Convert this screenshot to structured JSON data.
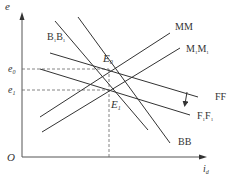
{
  "diagram": {
    "type": "economics-curves",
    "axes": {
      "y_label": "e",
      "x_label": "i",
      "x_label_sub": "d",
      "origin_label": "O"
    },
    "y_ticks": [
      {
        "label": "e",
        "sub": "0"
      },
      {
        "label": "e",
        "sub": "1"
      }
    ],
    "points": [
      {
        "label": "E",
        "sub": "0"
      },
      {
        "label": "E",
        "sub": "1"
      }
    ],
    "curves": {
      "MM": "MM",
      "M1M1": {
        "a": "M",
        "a_sub": "1",
        "b": "M",
        "b_sub": "1"
      },
      "B1B1": {
        "a": "B",
        "a_sub": "1",
        "b": "B",
        "b_sub": "1"
      },
      "BB": "BB",
      "FF": "FF",
      "F1F1": {
        "a": "F",
        "a_sub": "1",
        "b": "F",
        "b_sub": "1"
      }
    },
    "colors": {
      "line": "#333333",
      "axis": "#555555",
      "dashed": "#666666"
    }
  }
}
